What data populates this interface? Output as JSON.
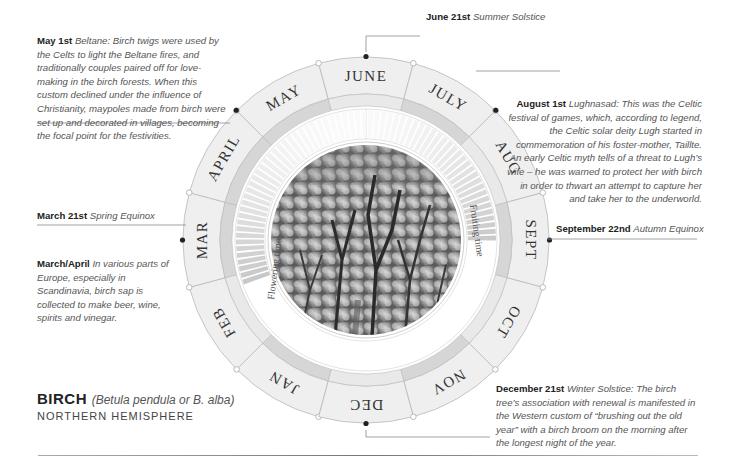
{
  "title": {
    "name": "BIRCH",
    "latin": "(Betula pendula or B. alba)",
    "hemisphere": "NORTHERN HEMISPHERE"
  },
  "wheel": {
    "center": [
      366,
      240
    ],
    "months": [
      "JAN",
      "FEB",
      "MAR",
      "APRIL",
      "MAY",
      "JUNE",
      "JULY",
      "AUG",
      "SEPT",
      "OCT",
      "NOV",
      "DEC"
    ],
    "inner_labels": {
      "flowering": "Flowering time",
      "fruiting": "Fruiting time"
    },
    "colors": {
      "month_band": "#efefef",
      "ring_stroke": "#b9b9b9",
      "inner_band": "#e9e9e9",
      "inner_band_dark": "#d6d6d6",
      "marker": "#222222",
      "photo_dark": "#6c6c6c"
    }
  },
  "notes": {
    "may": {
      "date": "May 1st",
      "text": "Beltane: Birch twigs were used by the Celts to light the Beltane fires, and traditionally couples paired off for love-making in the birch forests. When this custom declined under the influence of Christianity, maypoles made from birch were set up and decorated in villages, becoming the focal point for the festivities."
    },
    "june": {
      "date": "June 21st",
      "text": "Summer Solstice"
    },
    "august": {
      "date": "August 1st",
      "text": "Lughnasad: This was the Celtic festival of games, which, according to legend, the Celtic solar deity Lugh started in commemoration of his foster-mother, Taillte. An early Celtic myth tells of a threat to Lugh’s wife – he was warned to protect her with birch in order to thwart an attempt to capture her and take her to the underworld."
    },
    "march21": {
      "date": "March 21st",
      "text": "Spring Equinox"
    },
    "march_april": {
      "date": "March/April",
      "text": "In various parts of Europe, especially in Scandinavia, birch sap is collected to make beer, wine, spirits and vinegar."
    },
    "september": {
      "date": "September 22nd",
      "text": "Autumn Equinox"
    },
    "december": {
      "date": "December 21st",
      "text": "Winter Solstice: The birch tree’s association with renewal is manifested in the Western custom of “brushing out the old year” with a birch broom on the morning after the longest night of the year."
    }
  }
}
